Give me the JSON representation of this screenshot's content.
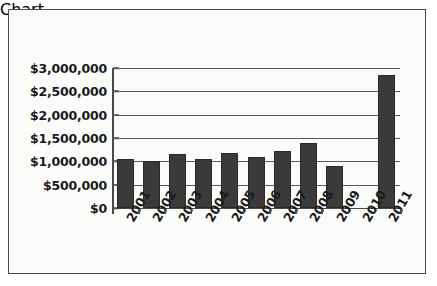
{
  "chart_data": {
    "type": "bar",
    "title": "",
    "subtitle": "",
    "xlabel": "",
    "ylabel": "",
    "categories": [
      "2001",
      "2002",
      "2003",
      "2004",
      "2005",
      "2006",
      "2007",
      "2008",
      "2009",
      "2010",
      "2011"
    ],
    "values": [
      1050000,
      1000000,
      1150000,
      1050000,
      1180000,
      1090000,
      1220000,
      1400000,
      900000,
      0,
      2850000
    ],
    "ylim": [
      0,
      3000000
    ],
    "ytick_values": [
      0,
      500000,
      1000000,
      1500000,
      2000000,
      2500000,
      3000000
    ],
    "ytick_labels": [
      "$0",
      "$500,000",
      "$1,000,000",
      "$1,500,000",
      "$2,000,000",
      "$2,500,000",
      "$3,000,000"
    ],
    "grid": true,
    "legend": false,
    "legend_position": "none",
    "bar_color": "#3a3a3a",
    "background_color": "#fbfbfa",
    "border_color": "#4a4a4a",
    "axis_color": "#4a4a4a",
    "gridline_color": "#5a5a5a",
    "text_color": "#1a1a1a",
    "annotations": [
      "2010 has no bar (no value plotted)"
    ]
  }
}
